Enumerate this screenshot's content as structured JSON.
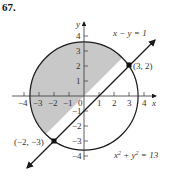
{
  "problem_number": "67.",
  "axes": {
    "x_label": "x",
    "y_label": "y",
    "x_ticks": [
      "−4",
      "−3",
      "−2",
      "−1",
      "0",
      "1",
      "2",
      "3",
      "4"
    ],
    "y_ticks": [
      "4",
      "3",
      "2",
      "1",
      "−1",
      "−2",
      "−3",
      "−4"
    ]
  },
  "curves": {
    "line_label": "x − y = 1",
    "circle_label_base": "x",
    "circle_label_mid": " + y",
    "circle_label_end": " = 13",
    "sup": "2"
  },
  "points": {
    "p1": "(3, 2)",
    "p2": "(−2, −3)"
  },
  "colors": {
    "shade": "#c8c8c8",
    "stroke": "#1a1a1a"
  }
}
